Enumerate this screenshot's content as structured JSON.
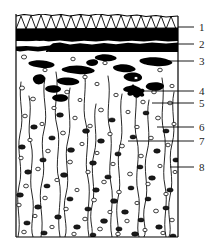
{
  "figure": {
    "background_color": "#ffffff",
    "ink_color": "#000000",
    "panel": {
      "x": 16,
      "y": 14,
      "width": 162,
      "height": 223
    },
    "layers": [
      {
        "id": "layer-1",
        "name": "zigzag-hatched-surface-band",
        "pattern": "zigzag",
        "fill": "#ffffff",
        "top": 14,
        "bottom": 28
      },
      {
        "id": "layer-2",
        "name": "upper-solid-black-band",
        "pattern": "solid",
        "fill": "#000000",
        "top": 28,
        "bottom": 40
      },
      {
        "id": "layer-3",
        "name": "lower-solid-black-band",
        "pattern": "solid",
        "fill": "#000000",
        "top": 36,
        "bottom": 52
      },
      {
        "id": "layer-4",
        "name": "pale-matrix-with-inclusions",
        "pattern": "stippled",
        "fill": "#ffffff",
        "top": 52,
        "bottom": 237
      }
    ],
    "callouts": [
      {
        "number": "1",
        "label_x": 200,
        "label_y": 31,
        "line_y": 27,
        "line_x_start": 178,
        "line_x_end": 194
      },
      {
        "number": "2",
        "label_x": 200,
        "label_y": 48,
        "line_y": 44,
        "line_x_start": 178,
        "line_x_end": 194
      },
      {
        "number": "3",
        "label_x": 200,
        "label_y": 65,
        "line_y": 61,
        "line_x_start": 148,
        "line_x_end": 194
      },
      {
        "number": "4",
        "label_x": 200,
        "label_y": 95,
        "line_y": 91,
        "line_x_start": 131,
        "line_x_end": 194
      },
      {
        "number": "5",
        "label_x": 200,
        "label_y": 107,
        "line_y": 103,
        "line_x_start": 152,
        "line_x_end": 194
      },
      {
        "number": "6",
        "label_x": 200,
        "label_y": 131,
        "line_y": 127,
        "line_x_start": 157,
        "line_x_end": 194
      },
      {
        "number": "7",
        "label_x": 200,
        "label_y": 145,
        "line_y": 141,
        "line_x_start": 128,
        "line_x_end": 194
      },
      {
        "number": "8",
        "label_x": 200,
        "label_y": 171,
        "line_y": 167,
        "line_x_start": 170,
        "line_x_end": 194
      }
    ]
  }
}
